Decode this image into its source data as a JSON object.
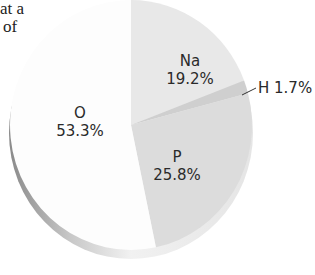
{
  "text_fragments": [
    "at a",
    "of"
  ],
  "chart_data": {
    "type": "pie",
    "title": "",
    "slices": [
      {
        "label": "Na",
        "value": 19.2,
        "display": "19.2%",
        "color": "#e8e8e8"
      },
      {
        "label": "H",
        "value": 1.7,
        "display": "H 1.7%",
        "color": "#cfcfcf"
      },
      {
        "label": "P",
        "value": 25.8,
        "display": "25.8%",
        "color": "#dcdcdc"
      },
      {
        "label": "O",
        "value": 53.3,
        "display": "53.3%",
        "color": "#fdfdfd"
      }
    ],
    "start_angle_deg": -90,
    "direction": "clockwise",
    "legend": "none"
  }
}
